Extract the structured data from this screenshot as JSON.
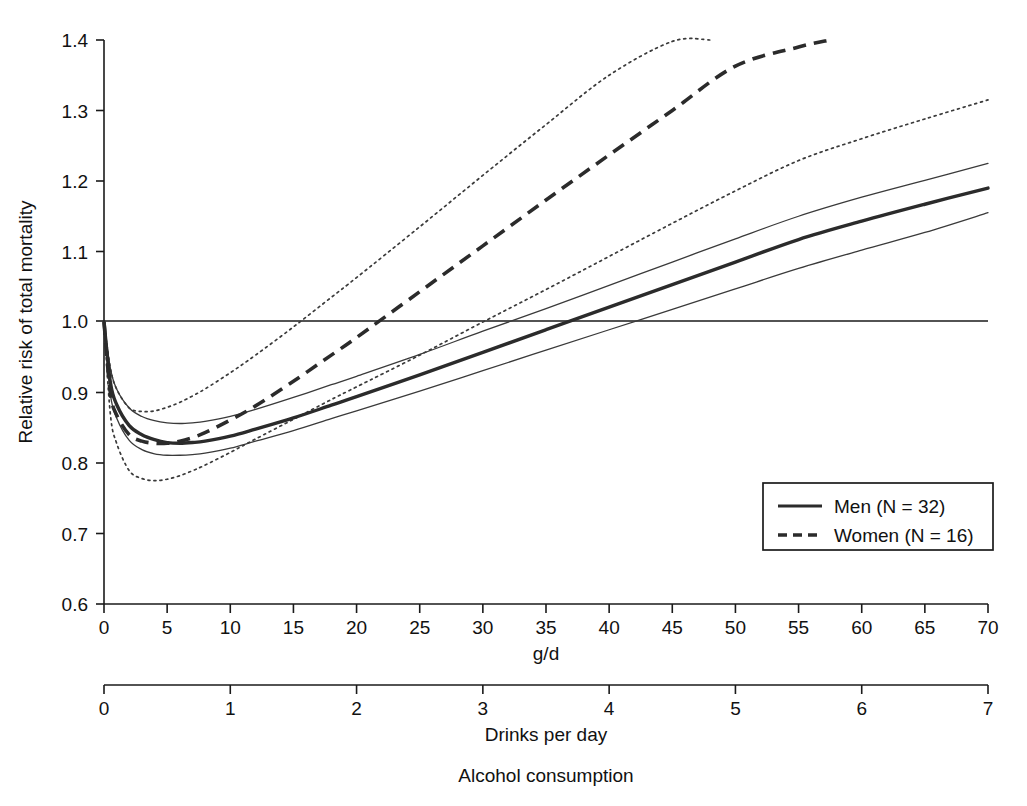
{
  "chart_data": {
    "type": "line",
    "title": "",
    "xlabel": "Alcohol consumption",
    "ylabel": "Relative risk of total mortality",
    "primary_x_axis": {
      "label": "g/d",
      "ticks": [
        0,
        5,
        10,
        15,
        20,
        25,
        30,
        35,
        40,
        45,
        50,
        55,
        60,
        65,
        70
      ],
      "tick_labels": [
        "0",
        "5",
        "10",
        "15",
        "20",
        "25",
        "30",
        "35",
        "40",
        "45",
        "50",
        "55",
        "60",
        "65",
        "70"
      ],
      "xlim": [
        0,
        70
      ]
    },
    "secondary_x_axis": {
      "label": "Drinks per day",
      "ticks": [
        0,
        1,
        2,
        3,
        4,
        5,
        6,
        7
      ],
      "tick_labels": [
        "0",
        "1",
        "2",
        "3",
        "4",
        "5",
        "6",
        "7"
      ],
      "xlim": [
        0,
        7
      ]
    },
    "y_axis": {
      "ticks": [
        0.6,
        0.7,
        0.8,
        0.9,
        1.0,
        1.1,
        1.2,
        1.3,
        1.4
      ],
      "tick_labels": [
        "0.6",
        "0.7",
        "0.8",
        "0.9",
        "1.0",
        "1.1",
        "1.2",
        "1.3",
        "1.4"
      ],
      "ylim": [
        0.6,
        1.4
      ]
    },
    "reference_line": {
      "y": 1.0,
      "style": "solid"
    },
    "grid": false,
    "legend_position": "lower-right",
    "legend": [
      {
        "name": "Men (N = 32)",
        "style": "solid"
      },
      {
        "name": "Women (N = 16)",
        "style": "dashed"
      }
    ],
    "series": [
      {
        "name": "Men (N = 32)",
        "role": "mean",
        "style": "solid-thick",
        "x": [
          0,
          0.5,
          1,
          2,
          3,
          4,
          5,
          6,
          7,
          8,
          10,
          12,
          15,
          18,
          20,
          25,
          30,
          35,
          40,
          45,
          50,
          55,
          60,
          65,
          70
        ],
        "y": [
          1.0,
          0.915,
          0.883,
          0.853,
          0.84,
          0.833,
          0.829,
          0.828,
          0.829,
          0.831,
          0.838,
          0.848,
          0.864,
          0.882,
          0.894,
          0.925,
          0.957,
          0.989,
          1.021,
          1.053,
          1.085,
          1.117,
          1.143,
          1.167,
          1.19
        ]
      },
      {
        "name": "Men upper 95% CI",
        "role": "ci-upper",
        "style": "solid-thin",
        "x": [
          0,
          0.5,
          1,
          2,
          3,
          4,
          5,
          6,
          7,
          8,
          10,
          12,
          15,
          18,
          20,
          25,
          30,
          35,
          40,
          45,
          50,
          55,
          60,
          65,
          70
        ],
        "y": [
          1.0,
          0.935,
          0.905,
          0.878,
          0.866,
          0.86,
          0.857,
          0.856,
          0.857,
          0.859,
          0.866,
          0.876,
          0.893,
          0.911,
          0.923,
          0.954,
          0.987,
          1.019,
          1.052,
          1.085,
          1.118,
          1.15,
          1.177,
          1.201,
          1.225
        ]
      },
      {
        "name": "Men lower 95% CI",
        "role": "ci-lower",
        "style": "solid-thin",
        "x": [
          0,
          0.5,
          1,
          2,
          3,
          4,
          5,
          6,
          7,
          8,
          10,
          12,
          15,
          18,
          20,
          25,
          30,
          35,
          40,
          45,
          50,
          55,
          60,
          65,
          70
        ],
        "y": [
          1.0,
          0.898,
          0.864,
          0.832,
          0.819,
          0.813,
          0.811,
          0.811,
          0.812,
          0.814,
          0.821,
          0.831,
          0.846,
          0.863,
          0.874,
          0.902,
          0.931,
          0.96,
          0.989,
          1.018,
          1.047,
          1.076,
          1.102,
          1.127,
          1.155
        ]
      },
      {
        "name": "Women (N = 16)",
        "role": "mean",
        "style": "dashed-thick",
        "x": [
          0,
          0.5,
          1,
          2,
          3,
          4,
          5,
          6,
          7,
          8,
          10,
          12,
          15,
          18,
          20,
          25,
          30,
          35,
          40,
          45,
          50,
          55,
          57.5
        ],
        "y": [
          1.0,
          0.9,
          0.868,
          0.84,
          0.831,
          0.828,
          0.828,
          0.831,
          0.836,
          0.843,
          0.861,
          0.881,
          0.916,
          0.953,
          0.978,
          1.043,
          1.108,
          1.173,
          1.237,
          1.3,
          1.363,
          1.39,
          1.4
        ]
      },
      {
        "name": "Women upper 95% CI",
        "role": "ci-upper",
        "style": "dotted",
        "x": [
          0,
          0.5,
          1,
          2,
          3,
          4,
          5,
          6,
          7,
          8,
          10,
          12,
          15,
          18,
          20,
          25,
          30,
          35,
          40,
          45,
          48
        ],
        "y": [
          1.0,
          0.935,
          0.905,
          0.878,
          0.873,
          0.874,
          0.879,
          0.886,
          0.895,
          0.905,
          0.928,
          0.953,
          0.993,
          1.035,
          1.063,
          1.135,
          1.208,
          1.28,
          1.35,
          1.398,
          1.4
        ]
      },
      {
        "name": "Women lower 95% CI",
        "role": "ci-lower",
        "style": "dotted",
        "x": [
          0,
          0.5,
          1,
          2,
          3,
          4,
          5,
          6,
          7,
          8,
          10,
          12,
          15,
          18,
          20,
          25,
          30,
          35,
          40,
          45,
          50,
          55,
          60,
          65,
          70
        ],
        "y": [
          1.0,
          0.87,
          0.828,
          0.789,
          0.778,
          0.775,
          0.777,
          0.782,
          0.789,
          0.797,
          0.815,
          0.834,
          0.862,
          0.89,
          0.908,
          0.953,
          1.0,
          1.046,
          1.093,
          1.14,
          1.186,
          1.229,
          1.26,
          1.288,
          1.315
        ]
      }
    ],
    "annotations": []
  },
  "labels": {
    "y_axis_title": "Relative risk of total mortality",
    "primary_x_title": "g/d",
    "secondary_x_title": "Drinks per day",
    "overall_x_title": "Alcohol consumption"
  },
  "legend": {
    "men_label": "Men (N = 32)",
    "women_label": "Women (N = 16)"
  },
  "colors": {
    "line": "#2b2b2b",
    "ci": "#3a3a3a",
    "axis": "#1a1a1a",
    "background": "#ffffff"
  }
}
